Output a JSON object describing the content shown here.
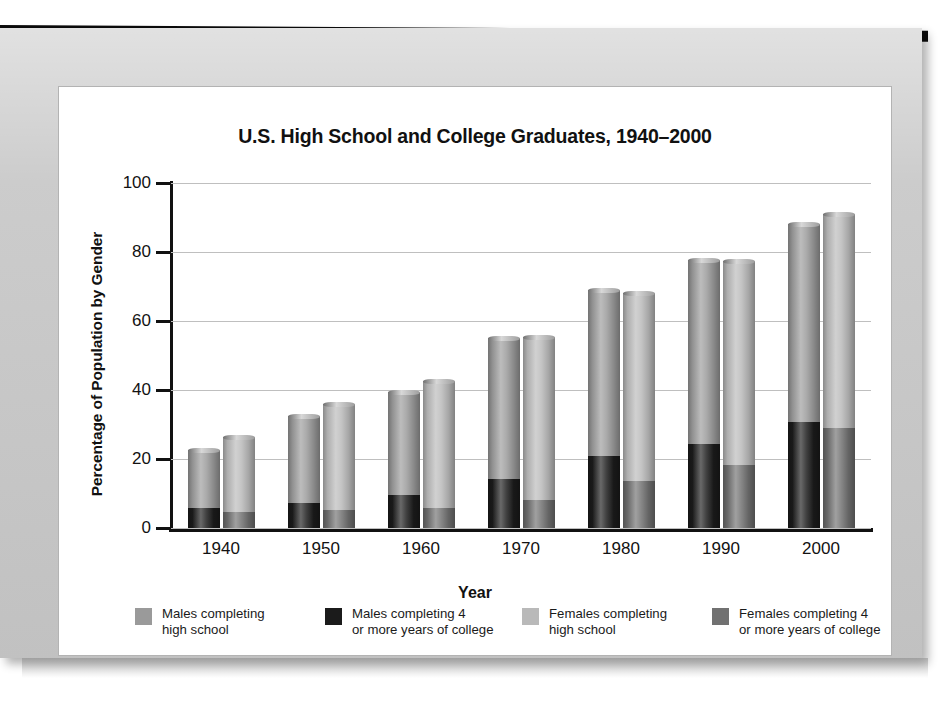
{
  "chart_data": {
    "type": "bar",
    "title": "U.S. High School and College Graduates, 1940–2000",
    "xlabel": "Year",
    "ylabel": "Percentage of Population by Gender",
    "ylim": [
      0,
      100
    ],
    "yticks": [
      0,
      20,
      40,
      60,
      80,
      100
    ],
    "grid": true,
    "stacked": true,
    "grouped": true,
    "legend_position": "bottom",
    "categories": [
      "1940",
      "1950",
      "1960",
      "1970",
      "1980",
      "1990",
      "2000"
    ],
    "series": [
      {
        "name": "Males completing high school",
        "group": "male",
        "stack_part": "high-school-total",
        "color": "#9a9a9a",
        "values": [
          22.7,
          32.6,
          39.5,
          55.0,
          69.1,
          77.7,
          88.2
        ]
      },
      {
        "name": "Males completing 4 or more years of college",
        "group": "male",
        "stack_part": "college",
        "color": "#1b1b1b",
        "values": [
          5.9,
          7.3,
          9.7,
          14.1,
          20.9,
          24.4,
          30.8
        ]
      },
      {
        "name": "Females completing high school",
        "group": "female",
        "stack_part": "high-school-total",
        "color": "#b9b9b9",
        "values": [
          26.3,
          36.0,
          42.5,
          55.4,
          68.1,
          77.5,
          91.0
        ]
      },
      {
        "name": "Females completing 4 or more years of college",
        "group": "female",
        "stack_part": "college",
        "color": "#6f6f6f",
        "values": [
          4.6,
          5.2,
          5.8,
          8.2,
          13.6,
          18.4,
          29.1
        ]
      }
    ]
  },
  "legend": {
    "items": [
      {
        "label": "Males completing\nhigh school",
        "swatch_class": "sw-hs-male"
      },
      {
        "label": "Males completing 4\nor more years of college",
        "swatch_class": "sw-col-male"
      },
      {
        "label": "Females completing\nhigh school",
        "swatch_class": "sw-hs-female"
      },
      {
        "label": "Females completing 4\nor more years of college",
        "swatch_class": "sw-col-female"
      }
    ]
  },
  "colors": {
    "panel": "#c9c9c9",
    "card": "#ffffff",
    "axis": "#111111",
    "gridline": "#bfbfbf",
    "males_high_school": "#9a9a9a",
    "males_college": "#1b1b1b",
    "females_high_school": "#b9b9b9",
    "females_college": "#6f6f6f"
  }
}
